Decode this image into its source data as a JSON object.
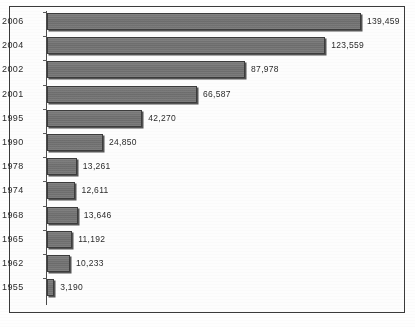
{
  "chart_data": {
    "type": "bar",
    "orientation": "horizontal",
    "title": "",
    "subtitle": "",
    "xlabel": "",
    "ylabel": "",
    "grid": false,
    "legend": null,
    "axis_line": "vertical-left",
    "xlim": [
      0,
      139459
    ],
    "categories": [
      "2006",
      "2004",
      "2002",
      "2001",
      "1995",
      "1990",
      "1978",
      "1974",
      "1968",
      "1965",
      "1962",
      "1955"
    ],
    "values": [
      139459,
      123559,
      87978,
      66587,
      42270,
      24850,
      13261,
      12611,
      13646,
      11192,
      10233,
      3190
    ],
    "value_labels": [
      "139,459",
      "123,559",
      "87,978",
      "66,587",
      "42,270",
      "24,850",
      "13,261",
      "12,611",
      "13,646",
      "11,192",
      "10,233",
      "3,190"
    ],
    "tick_labels": [
      "2006",
      "2004",
      "2002",
      "2001",
      "1995",
      "1990",
      "1978",
      "1974",
      "1968",
      "1965",
      "1962",
      "1955"
    ],
    "bar_color": "#737373",
    "bar_border_color": "#3c3c3c",
    "bar_shadow_color": "#373737",
    "text_color": "#2b2b2b",
    "frame_color": "#3a3a3a",
    "background_color": "#fdfdfd"
  },
  "caption": {
    "text": ""
  }
}
